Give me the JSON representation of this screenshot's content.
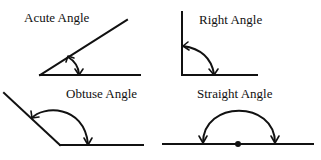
{
  "diagram": {
    "type": "angle-types",
    "panels": [
      {
        "id": "acute",
        "label": "Acute Angle",
        "description": "Two rays meeting at a vertex with an angle less than 90 degrees, double-headed arc arrow between them"
      },
      {
        "id": "right",
        "label": "Right Angle",
        "description": "Vertical and horizontal rays meeting at 90 degrees, double-headed arc arrow between them"
      },
      {
        "id": "obtuse",
        "label": "Obtuse Angle",
        "description": "Rays meeting at an angle greater than 90 degrees, double-headed arc arrow between them"
      },
      {
        "id": "straight",
        "label": "Straight Angle",
        "description": "Straight line with a center dot as vertex, semicircular double-headed arc arrow above (180 degrees)"
      }
    ],
    "colors": {
      "ink": "#111111",
      "background": "#ffffff"
    }
  }
}
